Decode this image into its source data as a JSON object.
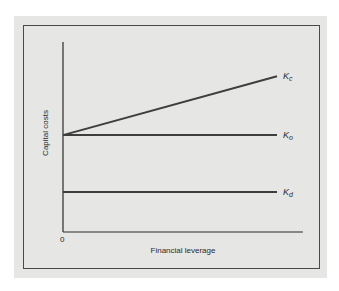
{
  "chart_data": {
    "type": "line",
    "title": "",
    "xlabel": "Financial leverage",
    "ylabel": "Capital costs",
    "x_tick_labels": [
      "0"
    ],
    "xlim": [
      0,
      1
    ],
    "ylim": [
      0,
      1
    ],
    "grid": false,
    "legend": "inline-right",
    "series": [
      {
        "name": "Kc",
        "base": "K",
        "sub": "c",
        "x": [
          0,
          1
        ],
        "y": [
          0.51,
          0.82
        ]
      },
      {
        "name": "Ko",
        "base": "K",
        "sub": "o",
        "x": [
          0,
          1
        ],
        "y": [
          0.51,
          0.51
        ]
      },
      {
        "name": "Kd",
        "base": "K",
        "sub": "d",
        "x": [
          0,
          1
        ],
        "y": [
          0.21,
          0.21
        ]
      }
    ]
  },
  "colors": {
    "line": "#3e3e3e",
    "axis": "#2a2a2a",
    "background": "#e6e6e4"
  }
}
